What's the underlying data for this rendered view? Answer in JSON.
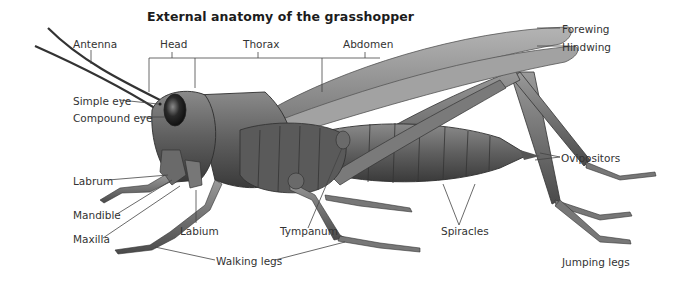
{
  "title": "External anatomy of the grasshopper",
  "labels": {
    "antenna": "Antenna",
    "head": "Head",
    "thorax": "Thorax",
    "abdomen": "Abdomen",
    "forewing": "Forewing",
    "hindwing": "Hindwing",
    "simple_eye": "Simple eye",
    "compound_eye": "Compound eye",
    "labrum": "Labrum",
    "mandible": "Mandible",
    "maxilla": "Maxilla",
    "labium": "Labium",
    "tympanum": "Tympanum",
    "spiracles": "Spiracles",
    "ovipositors": "Ovipositors",
    "walking_legs": "Walking legs",
    "jumping_legs": "Jumping legs"
  },
  "colors": {
    "background": "#ffffff",
    "body": "#6e6e6e",
    "body_dark": "#3f3f3f",
    "wing": "#9a9a9a",
    "leader_line": "#444444",
    "text": "#333333"
  }
}
